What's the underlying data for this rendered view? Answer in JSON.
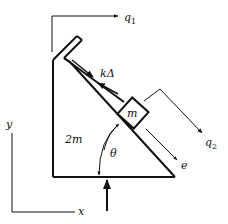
{
  "diagram": {
    "title": "",
    "colors": {
      "stroke": "#111111",
      "background": "#ffffff"
    },
    "labels": {
      "q1": "q",
      "q1_sub": "1",
      "q2": "q",
      "q2_sub": "2",
      "spring_force": "kΔ",
      "block_mass": "m",
      "wedge_mass": "2m",
      "angle": "θ",
      "slide_dir": "e",
      "y_axis": "y",
      "x_axis": "x"
    },
    "elements": [
      {
        "id": "wedge",
        "mass": "2m",
        "angle": "θ"
      },
      {
        "id": "block",
        "mass": "m",
        "on": "wedge incline"
      },
      {
        "id": "spring-slot",
        "force": "kΔ"
      },
      {
        "id": "coord-q1",
        "direction": "horizontal"
      },
      {
        "id": "coord-q2",
        "direction": "along incline"
      },
      {
        "id": "unit-vector-e",
        "direction": "down incline"
      },
      {
        "id": "normal-force-arrow",
        "direction": "up"
      },
      {
        "id": "axes",
        "x": "x",
        "y": "y"
      }
    ]
  }
}
